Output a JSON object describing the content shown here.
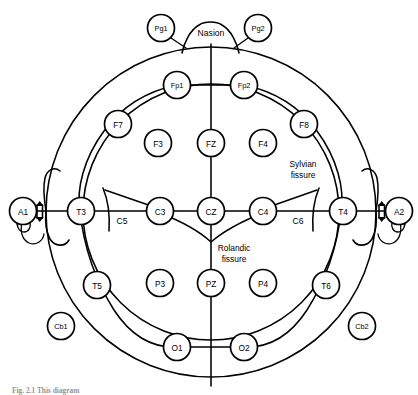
{
  "figure": {
    "caption": "Fig. 2.1   This diagram",
    "background_color": "#ffffff",
    "line_color": "#000000"
  },
  "landmarks": {
    "nasion_label": "Nasion"
  },
  "annotations": [
    {
      "id": "sylvian",
      "line1": "Sylvian",
      "line2": "fissure",
      "x": 303,
      "y": 164
    },
    {
      "id": "rolandic",
      "line1": "Rolandic",
      "line2": "fissure",
      "x": 234,
      "y": 248
    }
  ],
  "plain_labels": [
    {
      "id": "c5",
      "label": "C5",
      "x": 122,
      "y": 221
    },
    {
      "id": "c6",
      "label": "C6",
      "x": 298,
      "y": 221
    }
  ],
  "electrodes": [
    {
      "id": "Pg1",
      "label": "Pg1",
      "x": 161,
      "y": 28,
      "r": 13.5,
      "group": "sphenoidal",
      "small": true
    },
    {
      "id": "Pg2",
      "label": "Pg2",
      "x": 258,
      "y": 28,
      "r": 13.5,
      "group": "sphenoidal",
      "small": true
    },
    {
      "id": "Fp1",
      "label": "Fp1",
      "x": 177,
      "y": 85,
      "r": 13.5,
      "group": "prefrontal",
      "small": true
    },
    {
      "id": "Fp2",
      "label": "Fp2",
      "x": 244,
      "y": 85,
      "r": 13.5,
      "group": "prefrontal",
      "small": true
    },
    {
      "id": "F7",
      "label": "F7",
      "x": 118,
      "y": 124,
      "r": 13.5,
      "group": "frontal",
      "small": false
    },
    {
      "id": "F8",
      "label": "F8",
      "x": 304,
      "y": 124,
      "r": 13.5,
      "group": "frontal",
      "small": false
    },
    {
      "id": "F3",
      "label": "F3",
      "x": 158,
      "y": 143,
      "r": 13.5,
      "group": "frontal",
      "small": false
    },
    {
      "id": "FZ",
      "label": "FZ",
      "x": 211,
      "y": 143,
      "r": 13.5,
      "group": "frontal-midline",
      "small": false
    },
    {
      "id": "F4",
      "label": "F4",
      "x": 263,
      "y": 143,
      "r": 13.5,
      "group": "frontal",
      "small": false
    },
    {
      "id": "A1",
      "label": "A1",
      "x": 23,
      "y": 211,
      "r": 13.5,
      "group": "ear-reference",
      "small": false
    },
    {
      "id": "T3",
      "label": "T3",
      "x": 81,
      "y": 211,
      "r": 13.5,
      "group": "temporal",
      "small": false
    },
    {
      "id": "C3",
      "label": "C3",
      "x": 160,
      "y": 211,
      "r": 13.5,
      "group": "central",
      "small": false
    },
    {
      "id": "CZ",
      "label": "CZ",
      "x": 211,
      "y": 211,
      "r": 13.5,
      "group": "central-midline",
      "small": false
    },
    {
      "id": "C4",
      "label": "C4",
      "x": 263,
      "y": 211,
      "r": 13.5,
      "group": "central",
      "small": false
    },
    {
      "id": "T4",
      "label": "T4",
      "x": 343,
      "y": 211,
      "r": 13.5,
      "group": "temporal",
      "small": false
    },
    {
      "id": "A2",
      "label": "A2",
      "x": 399,
      "y": 211,
      "r": 13.5,
      "group": "ear-reference",
      "small": false
    },
    {
      "id": "T5",
      "label": "T5",
      "x": 97,
      "y": 285,
      "r": 13.5,
      "group": "temporal",
      "small": false
    },
    {
      "id": "P3",
      "label": "P3",
      "x": 160,
      "y": 283,
      "r": 13.5,
      "group": "parietal",
      "small": false
    },
    {
      "id": "PZ",
      "label": "PZ",
      "x": 211,
      "y": 283,
      "r": 13.5,
      "group": "parietal-midline",
      "small": false
    },
    {
      "id": "P4",
      "label": "P4",
      "x": 263,
      "y": 283,
      "r": 13.5,
      "group": "parietal",
      "small": false
    },
    {
      "id": "T6",
      "label": "T6",
      "x": 326,
      "y": 285,
      "r": 13.5,
      "group": "temporal",
      "small": false
    },
    {
      "id": "Cb1",
      "label": "Cb1",
      "x": 61,
      "y": 326,
      "r": 13.5,
      "group": "cerebellar",
      "small": true
    },
    {
      "id": "Cb2",
      "label": "Cb2",
      "x": 362,
      "y": 326,
      "r": 13.5,
      "group": "cerebellar",
      "small": true
    },
    {
      "id": "O1",
      "label": "O1",
      "x": 177,
      "y": 347,
      "r": 13.5,
      "group": "occipital",
      "small": false
    },
    {
      "id": "O2",
      "label": "O2",
      "x": 244,
      "y": 347,
      "r": 13.5,
      "group": "occipital",
      "small": false
    }
  ],
  "geometry": {
    "head_center_x": 211,
    "head_center_y": 212,
    "head_radius": 165,
    "ring_radius": 128,
    "midline_top_y": 44,
    "midline_bottom_y": 386,
    "crossline_y": 211
  }
}
